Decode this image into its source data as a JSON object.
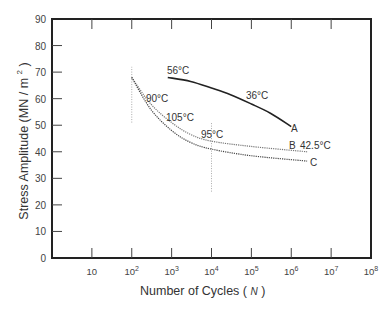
{
  "chart_data": {
    "type": "line",
    "title": "",
    "xlabel": "Number of Cycles ( N )",
    "ylabel": "Stress Amplitude (MN / m 2 )",
    "xscale": "log",
    "xlim": [
      1,
      100000000
    ],
    "ylim": [
      0,
      90
    ],
    "x_ticks": [
      "10",
      "10^2",
      "10^3",
      "10^4",
      "10^5",
      "10^6",
      "10^7",
      "10^8"
    ],
    "y_ticks": [
      0,
      10,
      20,
      30,
      40,
      50,
      60,
      70,
      80,
      90
    ],
    "grid": false,
    "legend": null,
    "series": [
      {
        "name": "A",
        "style": "solid",
        "color": "#222222",
        "points": [
          [
            800,
            68
          ],
          [
            3000,
            66.5
          ],
          [
            10000,
            64
          ],
          [
            30000,
            61.5
          ],
          [
            100000,
            58
          ],
          [
            300000,
            54.5
          ],
          [
            1000000,
            49.5
          ]
        ]
      },
      {
        "name": "B",
        "style": "dotted",
        "color": "#777777",
        "points": [
          [
            100,
            68
          ],
          [
            300,
            58
          ],
          [
            1000,
            51
          ],
          [
            3000,
            46.5
          ],
          [
            10000,
            44
          ],
          [
            100000,
            42
          ],
          [
            2500000,
            40
          ]
        ]
      },
      {
        "name": "C",
        "style": "dotted",
        "color": "#444444",
        "points": [
          [
            100,
            68
          ],
          [
            300,
            56
          ],
          [
            1000,
            48
          ],
          [
            3000,
            43.5
          ],
          [
            10000,
            41
          ],
          [
            100000,
            38.5
          ],
          [
            2500000,
            36.5
          ]
        ]
      }
    ],
    "annotations": [
      {
        "text": "56°C",
        "x": 900,
        "y": 69
      },
      {
        "text": "36°C",
        "x": 100000,
        "y": 59
      },
      {
        "text": "90°C",
        "x": 150,
        "y": 60
      },
      {
        "text": "105°C",
        "x": 700,
        "y": 52
      },
      {
        "text": "95°C",
        "x": 8000,
        "y": 45
      },
      {
        "text": "42.5°C",
        "x": 2500000,
        "y": 40
      },
      {
        "text": "A",
        "x": 1000000,
        "y": 48
      },
      {
        "text": "B",
        "x": 1000000,
        "y": 41
      },
      {
        "text": "C",
        "x": 3000000,
        "y": 35
      }
    ],
    "reference_lines": [
      {
        "orientation": "vertical",
        "x": 100,
        "y_range": [
          51,
          72
        ],
        "style": "dotted"
      },
      {
        "orientation": "vertical",
        "x": 10000,
        "y_range": [
          25,
          51
        ],
        "style": "dotted"
      }
    ]
  },
  "labels": {
    "ylabel_text": "Stress Amplitude (MN / m",
    "ylabel_sup": "2",
    "ylabel_close": " )",
    "xlabel_text": "Number of Cycles ( ",
    "xlabel_var": "N",
    "xlabel_close": " )",
    "ann_56": "56°C",
    "ann_36": "36°C",
    "ann_90": "90°C",
    "ann_105": "105°C",
    "ann_95": "95°C",
    "ann_425": "42.5°C",
    "ann_A": "A",
    "ann_B": "B",
    "ann_C": "C"
  }
}
